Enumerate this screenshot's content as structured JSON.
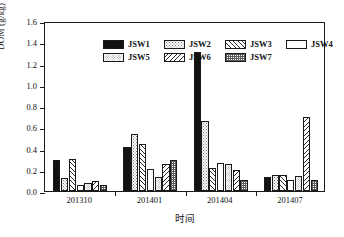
{
  "chart_data": {
    "type": "bar",
    "title": "",
    "xlabel": "时间",
    "ylabel": "DOM (g/kg)",
    "ylim": [
      0.0,
      1.6
    ],
    "ytick_step": 0.2,
    "grid": false,
    "legend_position": "top-inside",
    "categories": [
      "201310",
      "201401",
      "201404",
      "201407"
    ],
    "ytick_labels": [
      "0.0",
      "0.2",
      "0.4",
      "0.6",
      "0.8",
      "1.0",
      "1.2",
      "1.4",
      "1.6"
    ],
    "series": [
      {
        "name": "JSW1",
        "pattern": "solid-black",
        "values": [
          0.29,
          0.41,
          1.31,
          0.13
        ]
      },
      {
        "name": "JSW2",
        "pattern": "fine-dots",
        "values": [
          0.12,
          0.54,
          0.66,
          0.15
        ]
      },
      {
        "name": "JSW3",
        "pattern": "diagonal-up",
        "values": [
          0.3,
          0.44,
          0.22,
          0.15
        ]
      },
      {
        "name": "JSW4",
        "pattern": "white",
        "values": [
          0.06,
          0.21,
          0.26,
          0.1
        ]
      },
      {
        "name": "JSW5",
        "pattern": "light-dots",
        "values": [
          0.08,
          0.13,
          0.25,
          0.14
        ]
      },
      {
        "name": "JSW6",
        "pattern": "diagonal-down",
        "values": [
          0.09,
          0.25,
          0.2,
          0.7
        ]
      },
      {
        "name": "JSW7",
        "pattern": "dark-checker",
        "values": [
          0.06,
          0.29,
          0.1,
          0.1
        ]
      }
    ]
  },
  "legend": {
    "entries": [
      {
        "label": "JSW1"
      },
      {
        "label": "JSW2"
      },
      {
        "label": "JSW3"
      },
      {
        "label": "JSW4"
      },
      {
        "label": "JSW5"
      },
      {
        "label": "JSW6"
      },
      {
        "label": "JSW7"
      }
    ]
  },
  "colors": {
    "axis": "#1a1a1a",
    "text": "#111111",
    "background": "#ffffff",
    "jsw1": "#111111",
    "pattern_stroke": "#2a2a2a"
  }
}
